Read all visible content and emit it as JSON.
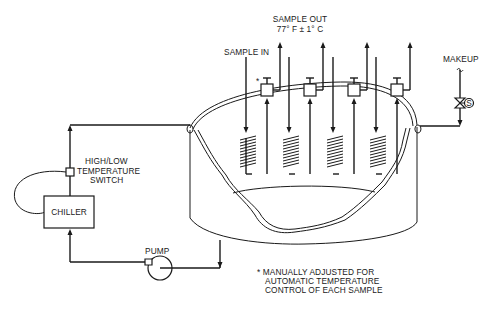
{
  "diagram": {
    "type": "process-schematic",
    "labels": {
      "sample_out_line1": "SAMPLE OUT",
      "sample_out_line2": "77° F ± 1° C",
      "sample_in": "SAMPLE IN",
      "makeup": "MAKEUP",
      "switch_line1": "HIGH/LOW",
      "switch_line2": "TEMPERATURE",
      "switch_line3": "SWITCH",
      "chiller": "CHILLER",
      "pump": "PUMP",
      "valve_symbol": "S",
      "adjust_marker": "*",
      "note_line1": "* MANUALLY ADJUSTED FOR",
      "note_line2": "AUTOMATIC TEMPERATURE",
      "note_line3": "CONTROL OF EACH SAMPLE"
    },
    "components": [
      {
        "id": "bath-tank",
        "label": "Tank (cutaway)"
      },
      {
        "id": "chiller",
        "label": "CHILLER"
      },
      {
        "id": "pump",
        "label": "PUMP"
      },
      {
        "id": "temperature-switch",
        "label": "HIGH/LOW TEMPERATURE SWITCH"
      },
      {
        "id": "makeup-solenoid-valve",
        "label": "S"
      },
      {
        "id": "sample-coils",
        "count": 4
      },
      {
        "id": "adjustment-valves",
        "count": 4
      }
    ],
    "colors": {
      "ink": "#1a1a1a",
      "background": "#ffffff"
    }
  }
}
